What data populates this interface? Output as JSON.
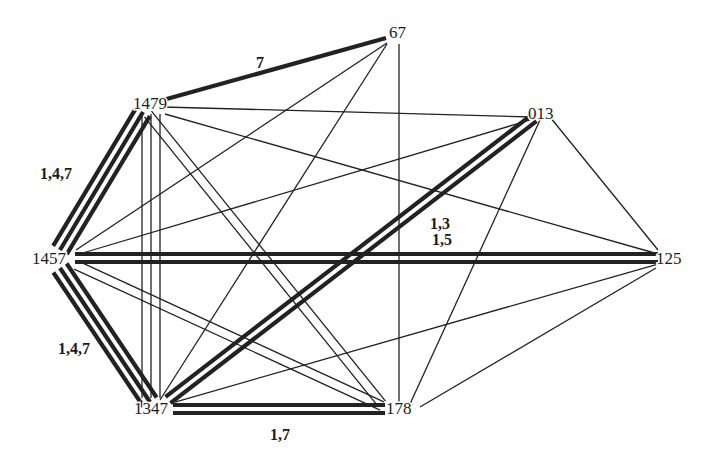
{
  "diagram": {
    "type": "graph",
    "nodes": [
      {
        "id": "67",
        "label": "67"
      },
      {
        "id": "1479",
        "label": "1479"
      },
      {
        "id": "013",
        "label": "013"
      },
      {
        "id": "1457",
        "label": "1457"
      },
      {
        "id": "125",
        "label": "125"
      },
      {
        "id": "1347",
        "label": "1347"
      },
      {
        "id": "178",
        "label": "178"
      }
    ],
    "edges": [
      {
        "from": "1479",
        "to": "67",
        "multiplicity": 1,
        "weight": "heavy",
        "label": "7"
      },
      {
        "from": "1479",
        "to": "1457",
        "multiplicity": 3,
        "weight": "heavy",
        "label": "1,4,7"
      },
      {
        "from": "1457",
        "to": "1347",
        "multiplicity": 3,
        "weight": "heavy",
        "label": "1,4,7"
      },
      {
        "from": "1457",
        "to": "125",
        "multiplicity": 2,
        "weight": "heavy",
        "label": "1,5"
      },
      {
        "from": "1347",
        "to": "013",
        "multiplicity": 2,
        "weight": "heavy",
        "label": "1,3"
      },
      {
        "from": "1347",
        "to": "178",
        "multiplicity": 2,
        "weight": "heavy",
        "label": "1,7"
      },
      {
        "from": "1479",
        "to": "013",
        "multiplicity": 1,
        "weight": "thin",
        "label": ""
      },
      {
        "from": "1479",
        "to": "125",
        "multiplicity": 1,
        "weight": "thin",
        "label": ""
      },
      {
        "from": "1479",
        "to": "178",
        "multiplicity": 2,
        "weight": "thin",
        "label": ""
      },
      {
        "from": "1479",
        "to": "1347",
        "multiplicity": 3,
        "weight": "thin",
        "label": ""
      },
      {
        "from": "67",
        "to": "1457",
        "multiplicity": 1,
        "weight": "thin",
        "label": ""
      },
      {
        "from": "67",
        "to": "1347",
        "multiplicity": 1,
        "weight": "thin",
        "label": ""
      },
      {
        "from": "67",
        "to": "178",
        "multiplicity": 1,
        "weight": "thin",
        "label": ""
      },
      {
        "from": "013",
        "to": "1457",
        "multiplicity": 1,
        "weight": "thin",
        "label": ""
      },
      {
        "from": "013",
        "to": "178",
        "multiplicity": 1,
        "weight": "thin",
        "label": ""
      },
      {
        "from": "013",
        "to": "125",
        "multiplicity": 1,
        "weight": "thin",
        "label": ""
      },
      {
        "from": "1457",
        "to": "178",
        "multiplicity": 2,
        "weight": "thin",
        "label": ""
      },
      {
        "from": "125",
        "to": "1347",
        "multiplicity": 1,
        "weight": "thin",
        "label": ""
      },
      {
        "from": "125",
        "to": "178",
        "multiplicity": 1,
        "weight": "thin",
        "label": ""
      },
      {
        "from": "1457",
        "to": "125",
        "multiplicity": 0,
        "weight": "thin",
        "label": ""
      }
    ],
    "colors": {
      "ink": "#222222",
      "background": "#ffffff"
    }
  }
}
